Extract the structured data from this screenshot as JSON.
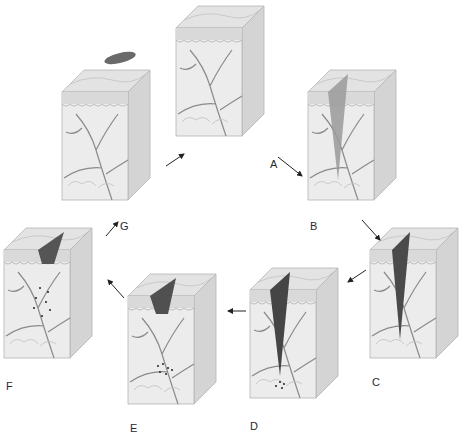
{
  "diagram": {
    "type": "cyclic-process",
    "stages": [
      {
        "id": "A",
        "label": "A",
        "description": "Intact skin block"
      },
      {
        "id": "B",
        "label": "B",
        "description": "Incision wound into dermis"
      },
      {
        "id": "C",
        "label": "C",
        "description": "Wound filled with blood clot"
      },
      {
        "id": "D",
        "label": "D",
        "description": "Clot with cells gathering at base"
      },
      {
        "id": "E",
        "label": "E",
        "description": "Scab with cell cluster beneath"
      },
      {
        "id": "F",
        "label": "F",
        "description": "Scab with spreading cells in dermis"
      },
      {
        "id": "G",
        "label": "G",
        "description": "Healed skin, scab detached above"
      }
    ],
    "flow": [
      "A",
      "B",
      "C",
      "D",
      "E",
      "F",
      "G",
      "A"
    ],
    "colors": {
      "background": "#ffffff",
      "tissue": "#ececec",
      "tissue_side": "#d4d4d4",
      "epidermis": "#c9c9c9",
      "vessel": "#7a7a7a",
      "clot": "#4a4a4a",
      "label": "#2a2a2a"
    }
  }
}
